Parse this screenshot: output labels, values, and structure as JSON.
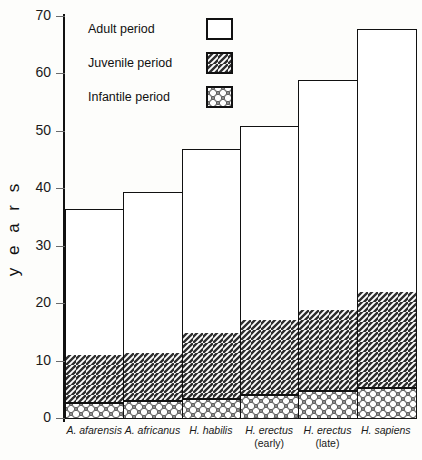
{
  "chart_data": {
    "type": "bar",
    "subtype": "stacked-bar",
    "title": "",
    "xlabel": "",
    "ylabel": "y e a r s",
    "ylabel_plain": "years",
    "ylim": [
      0,
      70
    ],
    "yticks": [
      0,
      10,
      20,
      30,
      40,
      50,
      60,
      70
    ],
    "ytick_labels": [
      "0",
      "10",
      "20",
      "30",
      "40",
      "50",
      "60",
      "70"
    ],
    "grid": false,
    "legend_position": "upper-left-inside",
    "categories": [
      "A. afarensis",
      "A. africanus",
      "H. habilis",
      "H. erectus (early)",
      "H. erectus (late)",
      "H. sapiens"
    ],
    "series": [
      {
        "name": "Infantile period",
        "pattern": "dots",
        "values": [
          2.6,
          3.0,
          3.3,
          4.0,
          4.7,
          5.2
        ]
      },
      {
        "name": "Juvenile period",
        "pattern": "diagonal-hatch",
        "values": [
          8.4,
          8.5,
          11.7,
          13.2,
          14.3,
          16.8
        ]
      },
      {
        "name": "Adult period",
        "pattern": "blank",
        "values": [
          25.5,
          28.0,
          32.0,
          33.8,
          40.0,
          46.0
        ]
      }
    ],
    "cumulative_tops": {
      "infantile": [
        2.6,
        3.0,
        3.3,
        4.0,
        4.7,
        5.2
      ],
      "juvenile": [
        11.0,
        11.5,
        15.0,
        17.2,
        19.0,
        22.0
      ],
      "total": [
        36.5,
        39.5,
        47.0,
        51.0,
        59.0,
        68.0
      ]
    }
  },
  "legend": {
    "items": [
      {
        "label": "Adult period",
        "swatch": "blank-swatch"
      },
      {
        "label": "Juvenile period",
        "swatch": "hatch-swatch"
      },
      {
        "label": "Infantile period",
        "swatch": "dots-swatch"
      }
    ]
  },
  "xaxis": {
    "labels": [
      {
        "main": "A. afarensis",
        "sub": ""
      },
      {
        "main": "A. africanus",
        "sub": ""
      },
      {
        "main": "H. habilis",
        "sub": ""
      },
      {
        "main": "H. erectus",
        "sub": "(early)"
      },
      {
        "main": "H. erectus",
        "sub": "(late)"
      },
      {
        "main": "H. sapiens",
        "sub": ""
      }
    ]
  },
  "colors": {
    "ink": "#111111",
    "background": "#fdfdfb",
    "adult_fill": "#ffffff",
    "juvenile_fill": "#efefef",
    "infantile_fill": "#d8d8d8"
  }
}
